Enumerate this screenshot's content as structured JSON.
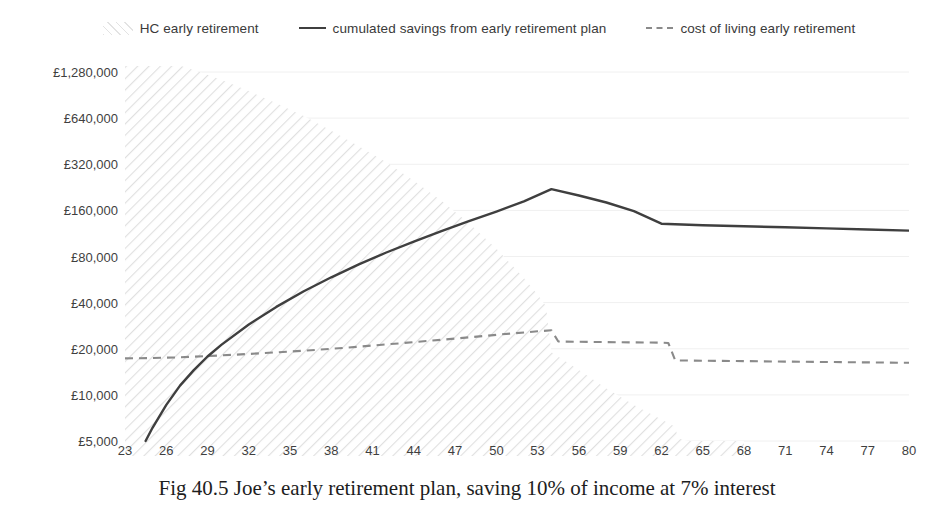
{
  "legend": {
    "position": "top-center",
    "entries": [
      {
        "label": "HC early retirement",
        "marker": "hatch-area-swatch-icon"
      },
      {
        "label": "cumulated savings from early retirement plan",
        "marker": "solid-line-swatch-icon"
      },
      {
        "label": "cost of living early retirement",
        "marker": "dashed-line-swatch-icon"
      }
    ]
  },
  "caption": "Fig 40.5 Joe’s early retirement plan, saving 10% of income at 7% interest",
  "colors": {
    "savings_line": "#3f3f3f",
    "cost_of_living_line": "#8a8a8a",
    "human_capital_hatch": "#e3e3e3",
    "gridline": "#f0f0f0",
    "text": "#3f3f3f",
    "caption_text": "#1d1d1d",
    "background": "#ffffff"
  },
  "chart_data": {
    "type": "line",
    "title": "",
    "subtitle": "",
    "xlabel": "",
    "ylabel": "",
    "grid": true,
    "yscale": "log2",
    "ylim": [
      5000,
      1280000
    ],
    "xlim": [
      23,
      80
    ],
    "ytick_labels": [
      "£1,280,000",
      "£640,000",
      "£320,000",
      "£160,000",
      "£80,000",
      "£40,000",
      "£20,000",
      "£10,000",
      "£5,000"
    ],
    "ytick_values": [
      1280000,
      640000,
      320000,
      160000,
      80000,
      40000,
      20000,
      10000,
      5000
    ],
    "xtick_labels": [
      "23",
      "26",
      "29",
      "32",
      "35",
      "38",
      "41",
      "44",
      "47",
      "50",
      "53",
      "56",
      "59",
      "62",
      "65",
      "68",
      "71",
      "74",
      "77",
      "80"
    ],
    "xtick_values": [
      23,
      26,
      29,
      32,
      35,
      38,
      41,
      44,
      47,
      50,
      53,
      56,
      59,
      62,
      65,
      68,
      71,
      74,
      77,
      80
    ],
    "series": [
      {
        "name": "HC early retirement",
        "type": "area",
        "style": "hatched",
        "x": [
          23,
          24,
          26,
          28,
          30,
          32,
          34,
          36,
          38,
          40,
          42,
          44,
          46,
          48,
          50,
          52,
          53,
          53.6,
          54,
          56,
          58,
          60,
          62,
          63,
          63.2,
          64,
          66,
          68
        ],
        "values": [
          1800000,
          1700000,
          1500000,
          1320000,
          1140000,
          960000,
          800000,
          660000,
          530000,
          420000,
          330000,
          250000,
          185000,
          132000,
          90000,
          58000,
          45000,
          38000,
          19000,
          14500,
          11000,
          8600,
          6900,
          6200,
          5200,
          5000,
          5000,
          5000
        ]
      },
      {
        "name": "cumulated savings from early retirement plan",
        "type": "line",
        "style": "solid",
        "x": [
          24.5,
          25,
          26,
          27,
          28,
          29,
          30,
          32,
          34,
          36,
          38,
          40,
          42,
          44,
          46,
          48,
          50,
          52,
          54,
          56,
          58,
          60,
          62,
          65,
          68,
          71,
          74,
          77,
          80
        ],
        "values": [
          5000,
          6100,
          8600,
          11500,
          14500,
          17800,
          21200,
          28800,
          37500,
          47500,
          58500,
          71000,
          85000,
          100000,
          117000,
          136000,
          157000,
          183000,
          220000,
          200000,
          180000,
          158000,
          131000,
          128000,
          126000,
          124000,
          122000,
          120000,
          118000
        ]
      },
      {
        "name": "cost of living early retirement",
        "type": "line",
        "style": "dashed",
        "x": [
          23,
          25,
          27,
          29,
          31,
          33,
          35,
          37,
          39,
          41,
          43,
          45,
          47,
          49,
          51,
          53,
          54,
          54.5,
          56,
          58,
          60,
          62,
          62.5,
          63,
          65,
          68,
          71,
          74,
          77,
          80
        ],
        "values": [
          17300,
          17400,
          17600,
          17900,
          18300,
          18700,
          19200,
          19700,
          20300,
          21000,
          21700,
          22500,
          23300,
          24200,
          25100,
          26000,
          26400,
          22300,
          22200,
          22100,
          22000,
          21900,
          21800,
          16800,
          16700,
          16600,
          16500,
          16400,
          16300,
          16200
        ]
      }
    ]
  }
}
